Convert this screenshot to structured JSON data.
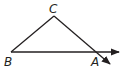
{
  "diagram": {
    "type": "geometry-triangle",
    "points": {
      "A": {
        "label": "A"
      },
      "B": {
        "label": "B"
      },
      "C": {
        "label": "C"
      }
    },
    "segments": [
      "BC",
      "CA"
    ],
    "rays": [
      "BA",
      "CA"
    ],
    "stroke_color": "#231f20"
  }
}
